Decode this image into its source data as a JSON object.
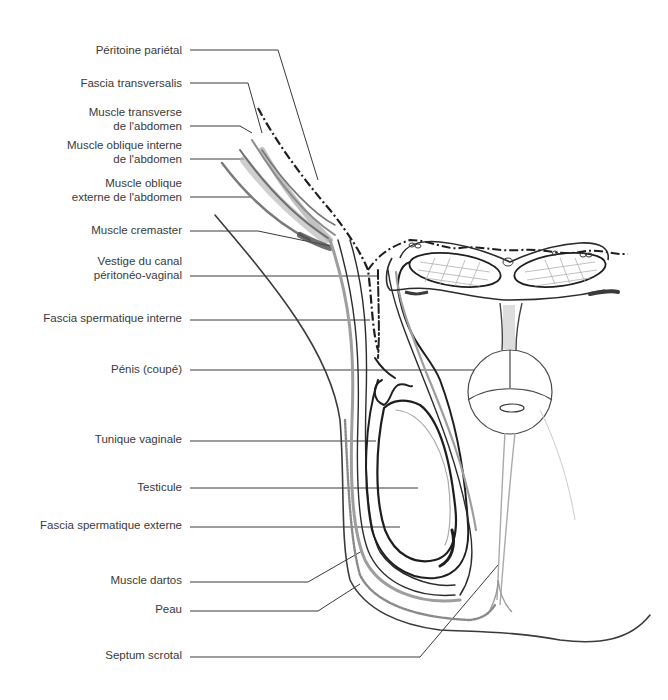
{
  "figure": {
    "type": "anatomical-diagram",
    "colors": {
      "background": "#ffffff",
      "ink": "#2b2b2b",
      "leader": "#3a3a3a",
      "muscle_gray": "#9a9a9a",
      "light_gray": "#bdbdbd"
    }
  },
  "labels": [
    {
      "id": "peritoine-parietal",
      "lines": [
        "Péritoine pariétal"
      ],
      "top": 40
    },
    {
      "id": "fascia-transversalis",
      "lines": [
        "Fascia transversalis"
      ],
      "top": 73
    },
    {
      "id": "muscle-transverse",
      "lines": [
        "Muscle transverse",
        "de l'abdomen"
      ],
      "top": 102
    },
    {
      "id": "muscle-oblique-interne",
      "lines": [
        "Muscle oblique interne",
        "de l'abdomen"
      ],
      "top": 135
    },
    {
      "id": "muscle-oblique-externe",
      "lines": [
        "Muscle oblique",
        "externe de l'abdomen"
      ],
      "top": 173
    },
    {
      "id": "muscle-cremaster",
      "lines": [
        "Muscle cremaster"
      ],
      "top": 222
    },
    {
      "id": "vestige-canal",
      "lines": [
        "Vestige du canal",
        "péritonéo-vaginal"
      ],
      "top": 253
    },
    {
      "id": "fascia-spermatique-interne",
      "lines": [
        "Fascia spermatique interne"
      ],
      "top": 310
    },
    {
      "id": "penis",
      "lines": [
        "Pénis (coupé)"
      ],
      "top": 363
    },
    {
      "id": "tunique-vaginale",
      "lines": [
        "Tunique vaginale"
      ],
      "top": 431
    },
    {
      "id": "testicule",
      "lines": [
        "Testicule"
      ],
      "top": 479
    },
    {
      "id": "fascia-spermatique-externe",
      "lines": [
        "Fascia spermatique externe"
      ],
      "top": 517
    },
    {
      "id": "muscle-dartos",
      "lines": [
        "Muscle dartos"
      ],
      "top": 572
    },
    {
      "id": "peau",
      "lines": [
        "Peau"
      ],
      "top": 601
    },
    {
      "id": "septum-scrotal",
      "lines": [
        "Septum scrotal"
      ],
      "top": 650
    }
  ]
}
